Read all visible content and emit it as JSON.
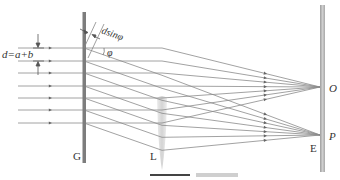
{
  "labels": {
    "grating": "G",
    "lens": "L",
    "screen": "E",
    "center_focus": "O",
    "off_focus": "P",
    "slit_spacing": "d=a+b",
    "path_difference": "dsinφ",
    "angle": "φ"
  },
  "geometry": {
    "incident_rays_y": [
      48,
      61,
      73,
      86,
      98,
      110,
      123
    ],
    "grating_x": 84,
    "grating_y": [
      12,
      163
    ],
    "lens_x": 162,
    "lens_y": [
      98,
      168
    ],
    "screen_x": 322,
    "screen_y": [
      5,
      172
    ],
    "focus_O": [
      320,
      87
    ],
    "focus_P": [
      320,
      135
    ],
    "diffraction_slope": 0.35
  },
  "colors": {
    "ray": "#8a8a8a",
    "grating": "#7d7d7d",
    "screen": "#b8b8b8",
    "lens": "#d9d9d9",
    "label": "#333333"
  }
}
